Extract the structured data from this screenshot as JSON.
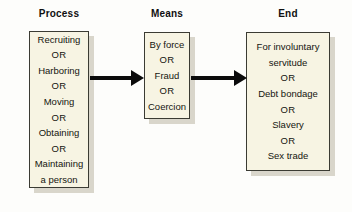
{
  "diagram": {
    "title_process": "Process",
    "title_means": "Means",
    "title_end": "End",
    "colors": {
      "box_fill": "#f7f4e3",
      "box_border": "#3b3b33",
      "shadow": "#d9d6cb",
      "arrow": "#0b0b0b",
      "text": "#15150f",
      "background": "#fdfdfb"
    },
    "columns": [
      {
        "name": "process",
        "header": "Process",
        "lines": [
          "Recruiting",
          "OR",
          "Harboring",
          "OR",
          "Moving",
          "OR",
          "Obtaining",
          "OR",
          "Maintaining\na person"
        ]
      },
      {
        "name": "means",
        "header": "Means",
        "lines": [
          "By force",
          "OR",
          "Fraud",
          "OR",
          "Coercion"
        ]
      },
      {
        "name": "end",
        "header": "End",
        "lines": [
          "For involuntary\nservitude",
          "OR",
          "Debt bondage",
          "OR",
          "Slavery",
          "OR",
          "Sex trade"
        ]
      }
    ],
    "connectors": [
      {
        "name": "arrow-process-to-means",
        "label": ""
      },
      {
        "name": "arrow-means-to-end",
        "label": ""
      }
    ]
  }
}
